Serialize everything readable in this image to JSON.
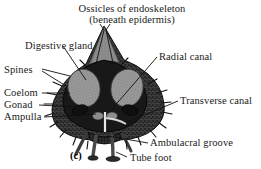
{
  "figure": {
    "caption": "(c)",
    "background_color": "#ffffff",
    "ink_color": "#1a1a1a",
    "organ_fill_color": "#9a9a9a",
    "body_fill_color": "#2b2b2b"
  },
  "labels": {
    "ossicles_line1": "Ossicles of endoskeleton",
    "ossicles_line2": "(beneath epidermis)",
    "digestive_gland": "Digestive gland",
    "spines": "Spines",
    "coelom": "Coelom",
    "gonad": "Gonad",
    "ampulla": "Ampulla",
    "radial_canal": "Radial canal",
    "transverse_canal": "Transverse canal",
    "ambulacral_groove": "Ambulacral groove",
    "tube_foot": "Tube foot"
  }
}
